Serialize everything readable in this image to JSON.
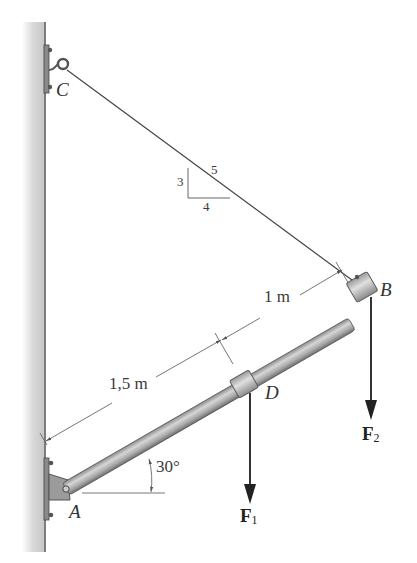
{
  "figure": {
    "type": "statics-diagram"
  },
  "points": {
    "A": "A",
    "B": "B",
    "C": "C",
    "D": "D"
  },
  "dimensions": {
    "AD": "1,5 m",
    "DB": "1 m",
    "angle": "30°"
  },
  "slope_triangle": {
    "rise": "3",
    "run": "4",
    "hyp": "5"
  },
  "forces": {
    "F1": {
      "symbol": "F",
      "subscript": "1"
    },
    "F2": {
      "symbol": "F",
      "subscript": "2"
    }
  },
  "colors": {
    "wall": "#c8c8c8",
    "rod": "#a8a8a8",
    "line": "#444444",
    "text": "#333333"
  }
}
